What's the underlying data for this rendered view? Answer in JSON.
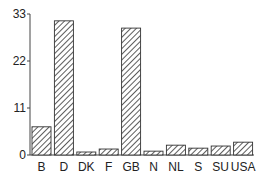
{
  "chart_data": {
    "type": "bar",
    "title": "",
    "xlabel": "",
    "ylabel": "",
    "categories": [
      "B",
      "D",
      "DK",
      "F",
      "GB",
      "N",
      "NL",
      "S",
      "SU",
      "USA"
    ],
    "values": [
      6.6,
      31.4,
      0.7,
      1.4,
      29.7,
      0.9,
      2.3,
      1.6,
      2.1,
      3.0
    ],
    "ylim": [
      0,
      33
    ],
    "yticks": [
      0,
      11,
      22,
      33
    ],
    "ytick_labels": [
      "0",
      "11",
      "22",
      "33"
    ],
    "grid": false,
    "legend": null,
    "fill_pattern": "diagonal-hatch"
  }
}
